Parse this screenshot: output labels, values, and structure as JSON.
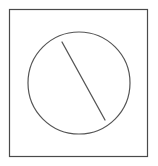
{
  "figure": {
    "canvas": {
      "width": 158,
      "height": 166,
      "background_color": "#ffffff"
    },
    "shapes": [
      {
        "name": "frame",
        "type": "rectangle",
        "x": 9.5,
        "y": 9.5,
        "width": 138,
        "height": 147,
        "stroke_color": "#4a4a4a",
        "stroke_width": 1.2,
        "fill_color": "#ffffff"
      },
      {
        "name": "circle",
        "type": "circle",
        "cx": 79,
        "cy": 83,
        "r": 51,
        "stroke_color": "#555555",
        "stroke_width": 1.2,
        "fill_color": "none"
      },
      {
        "name": "chord-line",
        "type": "line",
        "x1": 62,
        "y1": 42,
        "x2": 105,
        "y2": 120,
        "stroke_color": "#555555",
        "stroke_width": 1.3
      }
    ]
  }
}
